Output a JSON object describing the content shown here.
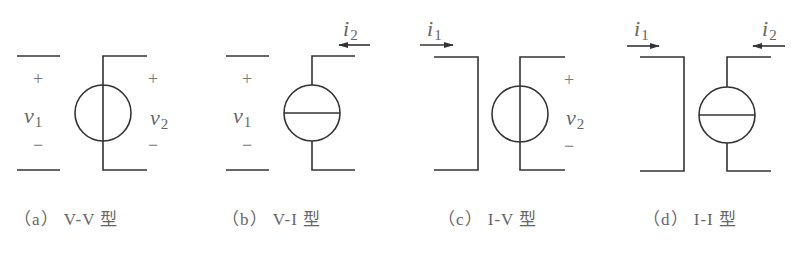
{
  "figure": {
    "panels": [
      {
        "id": "a",
        "caption": "（a） V-V 型",
        "left_port": {
          "plus": "+",
          "var": "v",
          "sub": "1",
          "minus": "−"
        },
        "right_port": {
          "plus": "+",
          "var": "v",
          "sub": "2",
          "minus": "−"
        },
        "source": "voltage-source"
      },
      {
        "id": "b",
        "caption": "（b） V-I 型",
        "left_port": {
          "plus": "+",
          "var": "v",
          "sub": "1",
          "minus": "−"
        },
        "right_port": {
          "current_var": "i",
          "current_sub": "2"
        },
        "source": "current-source"
      },
      {
        "id": "c",
        "caption": "（c） I-V 型",
        "left_port": {
          "current_var": "i",
          "current_sub": "1"
        },
        "right_port": {
          "plus": "+",
          "var": "v",
          "sub": "2",
          "minus": "−"
        },
        "source": "voltage-source"
      },
      {
        "id": "d",
        "caption": "（d） I-I 型",
        "left_port": {
          "current_var": "i",
          "current_sub": "1"
        },
        "right_port": {
          "current_var": "i",
          "current_sub": "2"
        },
        "source": "current-source"
      }
    ]
  },
  "colors": {
    "stroke": "#333333",
    "text": "#666666",
    "background": "#ffffff"
  }
}
